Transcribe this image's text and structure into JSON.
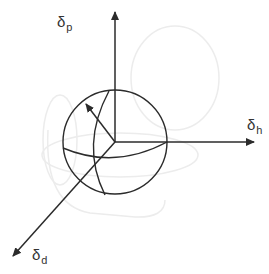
{
  "diagram": {
    "type": "3d-solubility-sphere",
    "axes": {
      "p": {
        "symbol": "δ",
        "subscript": "p",
        "direction": "up"
      },
      "h": {
        "symbol": "δ",
        "subscript": "h",
        "direction": "right"
      },
      "d": {
        "symbol": "δ",
        "subscript": "d",
        "direction": "down-left"
      }
    },
    "colors": {
      "line": "#2b2b2b",
      "ghost": "#ececec",
      "background": "#ffffff",
      "label": "#333333"
    }
  }
}
